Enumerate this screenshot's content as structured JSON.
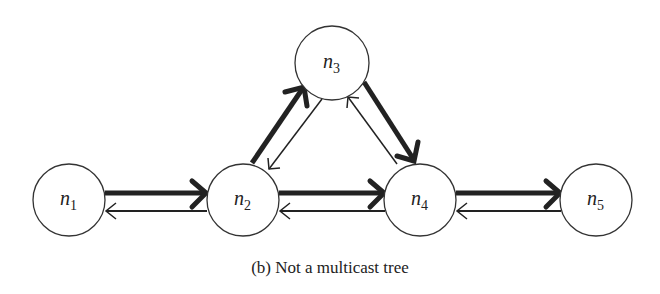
{
  "figure": {
    "caption": "(b) Not a multicast tree",
    "nodes": [
      {
        "id": "n1",
        "base": "n",
        "sub": "1",
        "x": 69,
        "y": 200
      },
      {
        "id": "n2",
        "base": "n",
        "sub": "2",
        "x": 243,
        "y": 200
      },
      {
        "id": "n3",
        "base": "n",
        "sub": "3",
        "x": 332,
        "y": 63
      },
      {
        "id": "n4",
        "base": "n",
        "sub": "4",
        "x": 420,
        "y": 200
      },
      {
        "id": "n5",
        "base": "n",
        "sub": "5",
        "x": 596,
        "y": 200
      }
    ],
    "edges": [
      {
        "from": "n1",
        "to": "n2",
        "style": "thick"
      },
      {
        "from": "n2",
        "to": "n1",
        "style": "thin"
      },
      {
        "from": "n2",
        "to": "n4",
        "style": "thick"
      },
      {
        "from": "n4",
        "to": "n2",
        "style": "thin"
      },
      {
        "from": "n4",
        "to": "n5",
        "style": "thick"
      },
      {
        "from": "n5",
        "to": "n4",
        "style": "thin"
      },
      {
        "from": "n2",
        "to": "n3",
        "style": "thick"
      },
      {
        "from": "n3",
        "to": "n2",
        "style": "thin"
      },
      {
        "from": "n3",
        "to": "n4",
        "style": "thick"
      },
      {
        "from": "n4",
        "to": "n3",
        "style": "thin"
      }
    ],
    "colors": {
      "stroke": "#222222",
      "background": "#ffffff"
    }
  }
}
